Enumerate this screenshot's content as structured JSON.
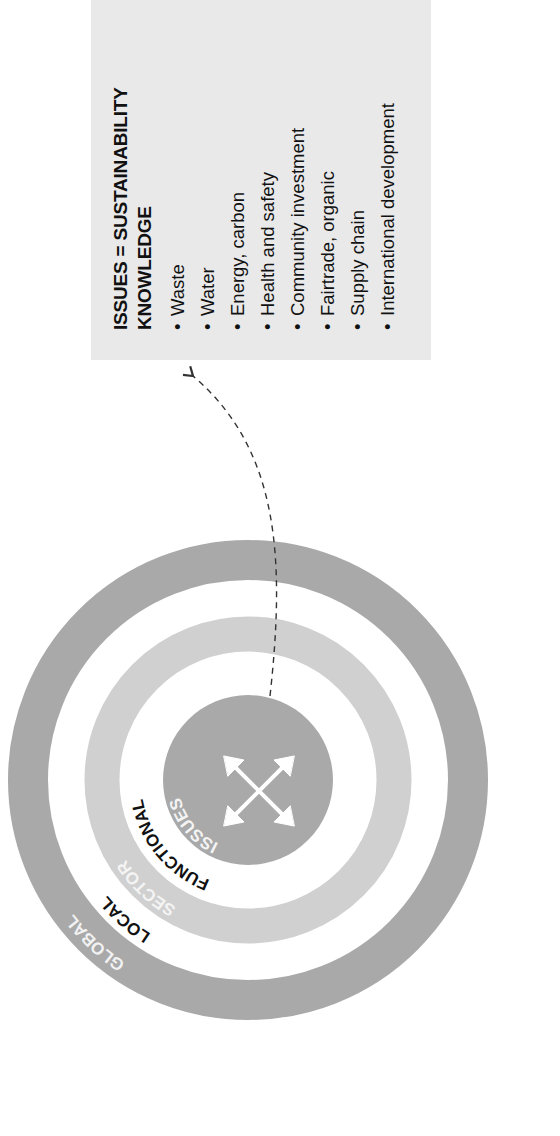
{
  "panel": {
    "title_line1": "ISSUES = SUSTAINABILITY",
    "title_line2": "KNOWLEDGE",
    "items": [
      "Waste",
      "Water",
      "Energy, carbon",
      "Health and safety",
      "Community investment",
      "Fairtrade, organic",
      "Supply chain",
      "International development"
    ],
    "bullet": "•"
  },
  "diagram": {
    "rings": [
      {
        "label": "GLOBAL",
        "color": "#a9a9a9",
        "label_color": "#f2f2f2"
      },
      {
        "label": "LOCAL",
        "color": "#ffffff",
        "label_color": "#111111"
      },
      {
        "label": "SECTOR",
        "color": "#d0d0d0",
        "label_color": "#f4f4f4"
      },
      {
        "label": "FUNCTIONAL",
        "color": "#ffffff",
        "label_color": "#111111"
      },
      {
        "label": "ISSUES",
        "color": "#a9a9a9",
        "label_color": "#f4f4f4"
      }
    ],
    "center_icon": "four-way-arrows-icon",
    "connector": "dashed-arrow"
  },
  "colors": {
    "panel_bg": "#e9e9e9",
    "dark_ring": "#a9a9a9",
    "light_ring": "#d0d0d0",
    "text": "#111111",
    "dash": "#333333"
  }
}
